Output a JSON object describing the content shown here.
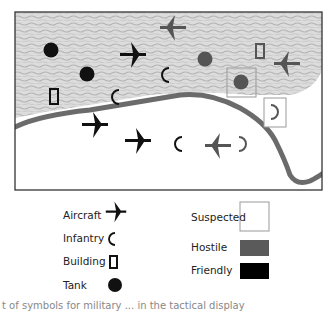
{
  "colors": {
    "friendly": "#111111",
    "hostile": "#555555",
    "terrain": "#d6d6d6",
    "river": "#6b6b6b",
    "suspected_box": "#9a9a9a"
  },
  "legend": {
    "symbols": [
      {
        "label": "Aircraft",
        "icon": "aircraft-icon"
      },
      {
        "label": "Infantry",
        "icon": "infantry-icon"
      },
      {
        "label": "Building",
        "icon": "building-icon"
      },
      {
        "label": "Tank",
        "icon": "tank-icon"
      }
    ],
    "affiliations": [
      {
        "label": "Suspected",
        "swatch": "#ffffff"
      },
      {
        "label": "Hostile",
        "swatch": "#5a5a5a"
      },
      {
        "label": "Friendly",
        "swatch": "#000000"
      }
    ]
  },
  "map": {
    "units": [
      {
        "type": "tank",
        "affiliation": "friendly",
        "x": 51,
        "y": 50
      },
      {
        "type": "tank",
        "affiliation": "friendly",
        "x": 87,
        "y": 74
      },
      {
        "type": "aircraft",
        "affiliation": "friendly",
        "x": 133,
        "y": 55
      },
      {
        "type": "aircraft",
        "affiliation": "hostile",
        "x": 173,
        "y": 28
      },
      {
        "type": "infantry",
        "affiliation": "friendly",
        "x": 165,
        "y": 75
      },
      {
        "type": "tank",
        "affiliation": "hostile",
        "x": 205,
        "y": 59
      },
      {
        "type": "building",
        "affiliation": "hostile",
        "x": 260,
        "y": 51
      },
      {
        "type": "aircraft",
        "affiliation": "hostile",
        "x": 287,
        "y": 64
      },
      {
        "type": "tank",
        "affiliation": "hostile",
        "x": 241,
        "y": 82,
        "suspected": true
      },
      {
        "type": "building",
        "affiliation": "friendly",
        "x": 54,
        "y": 97
      },
      {
        "type": "infantry",
        "affiliation": "friendly",
        "x": 115,
        "y": 97
      },
      {
        "type": "infantry",
        "affiliation": "hostile",
        "x": 275,
        "y": 112,
        "suspected": true
      },
      {
        "type": "aircraft",
        "affiliation": "friendly",
        "x": 95,
        "y": 125
      },
      {
        "type": "aircraft",
        "affiliation": "friendly",
        "x": 138,
        "y": 141
      },
      {
        "type": "infantry",
        "affiliation": "friendly",
        "x": 178,
        "y": 144
      },
      {
        "type": "aircraft",
        "affiliation": "hostile",
        "x": 218,
        "y": 146
      },
      {
        "type": "infantry",
        "affiliation": "hostile",
        "x": 243,
        "y": 144
      }
    ]
  },
  "caption": "t of symbols for military ... in the tactical display"
}
